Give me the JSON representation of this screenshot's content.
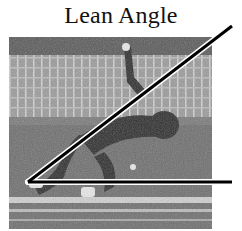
{
  "figure": {
    "title": "Lean Angle",
    "image_description": "Grayscale photo of a sprinter leaning forward from starting blocks on a track, stadium stands in the background",
    "annotation": {
      "type": "angle",
      "label": "Lean Angle",
      "vertex": [
        28,
        182
      ],
      "ray_diagonal_end": [
        232,
        26
      ],
      "ray_horizontal_end": [
        232,
        182
      ],
      "line_color": "#000000",
      "halo_color": "#ffffff"
    }
  }
}
